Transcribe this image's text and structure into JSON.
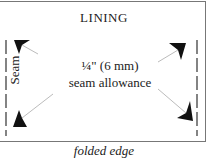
{
  "diagram": {
    "title": "LINING",
    "center_line1": "¼\" (6 mm)",
    "center_line2": "seam allowance",
    "side_label": "Seam",
    "caption": "folded edge",
    "colors": {
      "border": "#777777",
      "arrow": "#111111",
      "leader": "#aaaaaa",
      "seam_line": "#333333"
    }
  }
}
